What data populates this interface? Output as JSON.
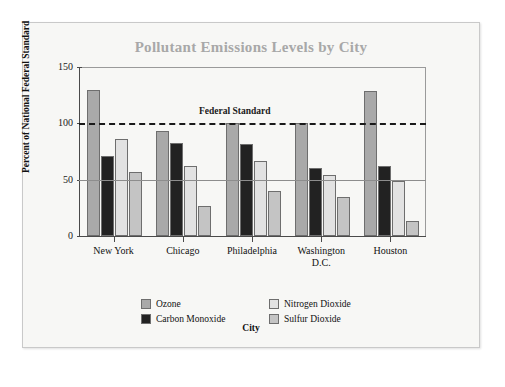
{
  "panel": {
    "title": "Pollutant Emissions Levels by City"
  },
  "chart_data": {
    "type": "bar",
    "title": "Pollutant Emissions Levels by City",
    "xlabel": "City",
    "ylabel": "Percent of National Federal Standard",
    "categories": [
      "New York",
      "Chicago",
      "Philadelphia",
      "Washington D.C.",
      "Houston"
    ],
    "category_lines": [
      [
        "New York"
      ],
      [
        "Chicago"
      ],
      [
        "Philadelphia"
      ],
      [
        "Washington",
        "D.C."
      ],
      [
        "Houston"
      ]
    ],
    "series": [
      {
        "name": "Ozone",
        "color": "#a9a9a9",
        "values": [
          130,
          93,
          100,
          100,
          129
        ]
      },
      {
        "name": "Carbon Monoxide",
        "color": "#222222",
        "values": [
          71,
          83,
          82,
          60,
          62
        ]
      },
      {
        "name": "Nitrogen Dioxide",
        "color": "#e2e2e2",
        "values": [
          86,
          62,
          67,
          54,
          49
        ]
      },
      {
        "name": "Sulfur Dioxide",
        "color": "#c4c4c4",
        "values": [
          57,
          27,
          40,
          35,
          13
        ]
      }
    ],
    "ylim": [
      0,
      150
    ],
    "yticks": [
      0,
      50,
      100,
      150
    ],
    "ytick_labels": [
      "0",
      "50",
      "100",
      "150"
    ],
    "gridlines": [
      50
    ],
    "grid": true,
    "legend_position": "bottom",
    "annotations": [
      {
        "label": "Federal Standard",
        "value": 100,
        "style": "dashed-line"
      }
    ]
  }
}
